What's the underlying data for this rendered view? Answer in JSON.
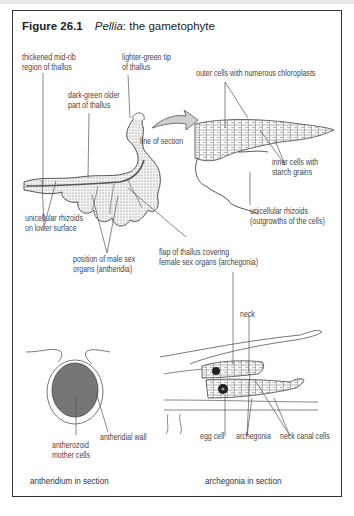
{
  "figure": {
    "number": "Figure 26.1",
    "title_italic": "Pellia",
    "title_rest": ": the gametophyte"
  },
  "gametophyte_labels": {
    "midrib_1": "thickened mid-rib",
    "midrib_2": "region of thallus",
    "tip_1": "lighter-green tip",
    "tip_2": "of thallus",
    "older_1": "dark-green older",
    "older_2": "part of thallus",
    "line_of_section": "line of section",
    "rhizoids_1": "unicellular rhizoids",
    "rhizoids_2": "on lower surface",
    "male_1": "position of male sex",
    "male_2": "organs (antheridia)",
    "flap_1": "flap of thallus covering",
    "flap_2": "female sex organs (archegonia)"
  },
  "section_labels": {
    "outer": "outer cells with numerous chloroplasts",
    "inner_1": "inner cells with",
    "inner_2": "starch grains",
    "rhiz_1": "unicellular rhizoids",
    "rhiz_2": "(outgrowths of the cells)"
  },
  "antheridium": {
    "wall": "antheridial wall",
    "mother_1": "antherozoid",
    "mother_2": "mother cells",
    "caption": "antheridium in section"
  },
  "archegonia": {
    "neck": "neck",
    "egg": "egg cell",
    "arch": "archegonia",
    "canal": "neck canal cells",
    "caption": "archegonia in section"
  },
  "colors": {
    "frame": "#333333",
    "line": "#555555",
    "arrow_fill": "#cfcfcf",
    "stipple": "#555555"
  }
}
